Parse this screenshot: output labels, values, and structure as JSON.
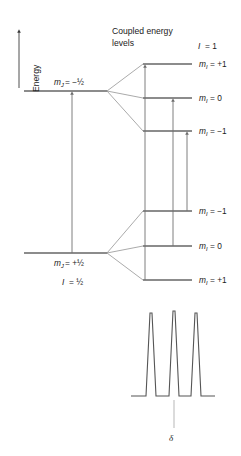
{
  "figure": {
    "type": "energy-level-diagram",
    "title_lines": [
      "Coupled energy",
      "levels"
    ],
    "energy_axis_label": "Energy",
    "spin_upper_label": {
      "symbol": "I",
      "equals": "= 1"
    },
    "spin_lower_label": {
      "symbol": "I",
      "equals": "= ½"
    },
    "left_levels": [
      {
        "id": "mj-minus-half",
        "symbol": "m",
        "subscript": "J",
        "value": "= −½",
        "y": 91
      },
      {
        "id": "mj-plus-half",
        "symbol": "m",
        "subscript": "J",
        "value": "= +½",
        "y": 253
      }
    ],
    "right_levels": [
      {
        "id": "upper-mi-plus1",
        "symbol": "m",
        "subscript": "I",
        "value": "= +1",
        "y": 64
      },
      {
        "id": "upper-mi-zero",
        "symbol": "m",
        "subscript": "I",
        "value": "= 0",
        "y": 98
      },
      {
        "id": "upper-mi-minus1",
        "symbol": "m",
        "subscript": "I",
        "value": "= −1",
        "y": 131
      },
      {
        "id": "lower-mi-minus1",
        "symbol": "m",
        "subscript": "I",
        "value": "= −1",
        "y": 211
      },
      {
        "id": "lower-mi-zero",
        "symbol": "m",
        "subscript": "I",
        "value": "= 0",
        "y": 246
      },
      {
        "id": "lower-mi-plus1",
        "symbol": "m",
        "subscript": "I",
        "value": "= +1",
        "y": 280
      }
    ],
    "transitions": [
      {
        "id": "transition-left",
        "x": 72,
        "from_y": 253,
        "to_y": 91
      },
      {
        "id": "transition-middle",
        "x": 145,
        "from_y": 280,
        "to_y": 64
      },
      {
        "id": "transition-right",
        "x": 173,
        "from_y": 246,
        "to_y": 98
      },
      {
        "id": "transition-far-right",
        "x": 187,
        "from_y": 211,
        "to_y": 131
      }
    ],
    "spectrum": {
      "axis_label": "δ",
      "baseline_y": 396,
      "peaks": [
        {
          "id": "peak-1",
          "x": 151,
          "height": 84
        },
        {
          "id": "peak-2",
          "x": 174,
          "height": 86
        },
        {
          "id": "peak-3",
          "x": 196,
          "height": 84
        }
      ],
      "delta_marker_x": 174
    },
    "colors": {
      "level_line": "#1a1a1a",
      "fan_line": "#8e8e8e",
      "arrow": "#6f6f6f",
      "spectrum": "#555555",
      "text": "#1a1a1a",
      "background": "#ffffff"
    }
  }
}
